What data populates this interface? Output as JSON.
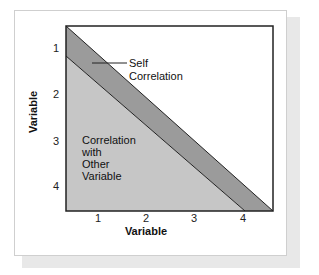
{
  "diagram": {
    "type": "correlation-matrix-regions",
    "x_axis": {
      "title": "Variable",
      "ticks": [
        "1",
        "2",
        "3",
        "4"
      ]
    },
    "y_axis": {
      "title": "Variable",
      "ticks": [
        "1",
        "2",
        "3",
        "4"
      ]
    },
    "regions": {
      "self_correlation": {
        "label_line1": "Self",
        "label_line2": "Correlation",
        "color": "#9b9b9b"
      },
      "other_correlation": {
        "label_lines": [
          "Correlation",
          "with",
          "Other",
          "Variable"
        ],
        "color": "#c6c6c6"
      }
    },
    "colors": {
      "background": "#ffffff",
      "shadow": "#e8e8e8",
      "border": "#222222"
    }
  }
}
